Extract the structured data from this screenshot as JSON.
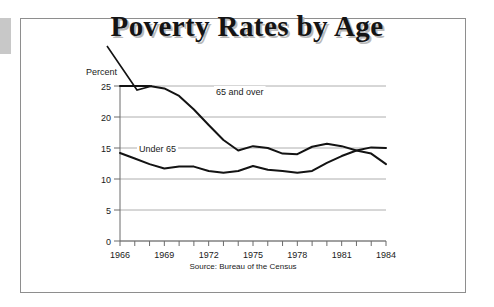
{
  "figure": {
    "title": "Poverty Rates by Age",
    "source_note": "Source: Bureau of the Census",
    "frame_color": "#8e8e8e",
    "line_color": "#131313",
    "grid_color": "#aeaeae"
  },
  "chart_data": {
    "type": "line",
    "title": "Poverty Rates by Age",
    "subtitle": "",
    "xlabel": "",
    "ylabel": "Percent",
    "ylim": [
      0,
      25
    ],
    "xlim": [
      1966,
      1984
    ],
    "grid": true,
    "legend_position": "inline-annotation",
    "yticks": [
      0,
      5,
      10,
      15,
      20,
      25
    ],
    "ytick_labels": [
      "0",
      "5",
      "10",
      "15",
      "20",
      "25"
    ],
    "x": [
      1966,
      1967,
      1968,
      1969,
      1970,
      1971,
      1972,
      1973,
      1974,
      1975,
      1976,
      1977,
      1978,
      1979,
      1980,
      1981,
      1982,
      1983,
      1984
    ],
    "xticks": [
      1966,
      1969,
      1972,
      1975,
      1978,
      1981,
      1984
    ],
    "xtick_labels": [
      "1966",
      "1969",
      "1972",
      "1975",
      "1978",
      "1981",
      "1984"
    ],
    "annotations": [
      {
        "text": "Percent",
        "role": "y-axis-caption"
      },
      {
        "text": "65 and over",
        "role": "series-label"
      },
      {
        "text": "Under 65",
        "role": "series-label"
      },
      {
        "text": "Source: Bureau of the Census",
        "role": "source"
      }
    ],
    "series": [
      {
        "name": "65 and over",
        "label": "65 and over",
        "values": [
          25.0,
          25.0,
          25.0,
          24.6,
          23.4,
          21.2,
          18.7,
          16.3,
          14.6,
          15.3,
          15.0,
          14.1,
          14.0,
          15.2,
          15.7,
          15.3,
          14.6,
          14.1,
          12.4
        ]
      },
      {
        "name": "Under 65",
        "label": "Under 65",
        "values": [
          14.2,
          13.3,
          12.4,
          11.7,
          12.0,
          12.0,
          11.3,
          11.0,
          11.3,
          12.1,
          11.5,
          11.3,
          11.0,
          11.3,
          12.6,
          13.7,
          14.6,
          15.1,
          15.0
        ]
      }
    ]
  }
}
